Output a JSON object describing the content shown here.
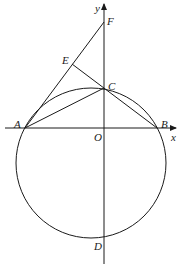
{
  "diagram": {
    "type": "geometry",
    "axes": {
      "x_label": "x",
      "y_label": "y",
      "origin_label": "O"
    },
    "points": {
      "A": "A",
      "B": "B",
      "C": "C",
      "D": "D",
      "E": "E",
      "F": "F",
      "O": "O"
    },
    "segments": [
      "AF",
      "AC",
      "EB",
      "AB"
    ],
    "circle": {
      "passes_through": [
        "A",
        "B",
        "C",
        "D"
      ]
    },
    "colors": {
      "stroke": "#1a1a1a",
      "background": "#ffffff"
    }
  }
}
